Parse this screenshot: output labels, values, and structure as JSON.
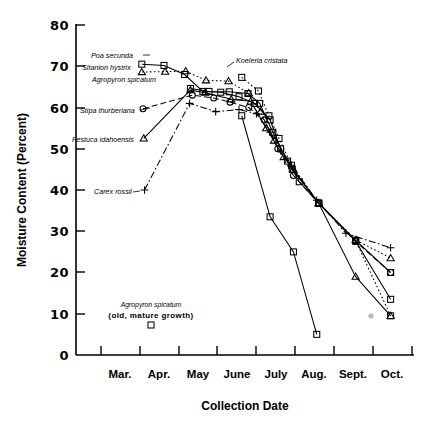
{
  "chart_data": {
    "type": "line",
    "title": "",
    "xlabel": "Collection Date",
    "ylabel": "Moisture Content (Percent)",
    "ylim": [
      0,
      80
    ],
    "yticks": [
      0,
      10,
      20,
      30,
      40,
      50,
      60,
      70,
      80
    ],
    "grid": false,
    "legend_position": "inline-labels",
    "x_categories": [
      "Mar.",
      "Apr.",
      "May",
      "June",
      "July",
      "Aug.",
      "Sept.",
      "Oct."
    ],
    "x_axis_note": "Tick marks delimit months; labels centered between ticks",
    "series": [
      {
        "name": "Poa secunda",
        "marker": "square",
        "dash": "solid",
        "points": [
          {
            "x": 2.05,
            "y": 70.5
          },
          {
            "x": 2.62,
            "y": 70.2
          },
          {
            "x": 3.15,
            "y": 68.0
          },
          {
            "x": 3.62,
            "y": 63.9
          },
          {
            "x": 4.08,
            "y": 63.7
          },
          {
            "x": 4.55,
            "y": 62.6
          },
          {
            "x": 4.95,
            "y": 61.0
          },
          {
            "x": 5.35,
            "y": 57.0
          },
          {
            "x": 5.62,
            "y": 50.0
          },
          {
            "x": 5.92,
            "y": 45.0
          },
          {
            "x": 6.6,
            "y": 36.8
          },
          {
            "x": 7.55,
            "y": 27.8
          },
          {
            "x": 8.45,
            "y": 20.0
          }
        ]
      },
      {
        "name": "Sitanion hystrix",
        "marker": "triangle",
        "dash": "dotted",
        "points": [
          {
            "x": 2.05,
            "y": 68.6
          },
          {
            "x": 2.65,
            "y": 68.7
          },
          {
            "x": 3.18,
            "y": 68.8
          },
          {
            "x": 3.7,
            "y": 66.6
          },
          {
            "x": 4.28,
            "y": 66.4
          },
          {
            "x": 4.8,
            "y": 63.5
          },
          {
            "x": 5.1,
            "y": 59.0
          },
          {
            "x": 5.45,
            "y": 52.0
          },
          {
            "x": 5.95,
            "y": 45.0
          },
          {
            "x": 6.6,
            "y": 36.8
          },
          {
            "x": 7.55,
            "y": 27.9
          },
          {
            "x": 8.45,
            "y": 23.5
          }
        ]
      },
      {
        "name": "Agropyron spicatum",
        "marker": "square",
        "dash": "solid",
        "points": [
          {
            "x": 3.3,
            "y": 64.6
          },
          {
            "x": 3.78,
            "y": 63.9
          },
          {
            "x": 4.3,
            "y": 63.8
          },
          {
            "x": 4.78,
            "y": 63.4
          },
          {
            "x": 5.08,
            "y": 61.0
          },
          {
            "x": 5.42,
            "y": 54.0
          },
          {
            "x": 5.8,
            "y": 47.0
          },
          {
            "x": 6.1,
            "y": 42.0
          },
          {
            "x": 6.6,
            "y": 36.8
          },
          {
            "x": 7.55,
            "y": 27.6
          },
          {
            "x": 8.45,
            "y": 13.5
          }
        ]
      },
      {
        "name": "Koeleria cristata",
        "marker": "square",
        "dash": "dotted",
        "points": [
          {
            "x": 4.62,
            "y": 67.3
          },
          {
            "x": 5.05,
            "y": 64.0
          },
          {
            "x": 5.32,
            "y": 58.0
          },
          {
            "x": 5.58,
            "y": 52.5
          },
          {
            "x": 5.9,
            "y": 46.0
          },
          {
            "x": 6.6,
            "y": 36.8
          },
          {
            "x": 7.55,
            "y": 27.7
          },
          {
            "x": 8.45,
            "y": 9.5
          }
        ]
      },
      {
        "name": "Stipa thurberiana",
        "marker": "circle",
        "dash": "dashed",
        "points": [
          {
            "x": 2.08,
            "y": 59.7
          },
          {
            "x": 3.35,
            "y": 63.0
          },
          {
            "x": 3.9,
            "y": 62.3
          },
          {
            "x": 4.32,
            "y": 61.3
          },
          {
            "x": 4.8,
            "y": 60.0
          },
          {
            "x": 5.2,
            "y": 57.0
          },
          {
            "x": 5.55,
            "y": 50.0
          },
          {
            "x": 5.95,
            "y": 43.5
          },
          {
            "x": 6.6,
            "y": 36.8
          },
          {
            "x": 7.55,
            "y": 27.5
          },
          {
            "x": 8.45,
            "y": 20.0
          }
        ]
      },
      {
        "name": "Festuca idahoensis",
        "marker": "triangle",
        "dash": "solid",
        "points": [
          {
            "x": 2.1,
            "y": 52.5
          },
          {
            "x": 3.3,
            "y": 64.2
          },
          {
            "x": 3.68,
            "y": 63.6
          },
          {
            "x": 4.35,
            "y": 62.0
          },
          {
            "x": 4.85,
            "y": 61.5
          },
          {
            "x": 5.25,
            "y": 55.0
          },
          {
            "x": 5.7,
            "y": 48.0
          },
          {
            "x": 6.6,
            "y": 36.8
          },
          {
            "x": 7.55,
            "y": 19.0
          },
          {
            "x": 8.45,
            "y": 9.5
          }
        ]
      },
      {
        "name": "Carex rossii",
        "marker": "plus",
        "dash": "dashdot",
        "points": [
          {
            "x": 2.12,
            "y": 40.0
          },
          {
            "x": 3.28,
            "y": 61.0
          },
          {
            "x": 3.95,
            "y": 59.0
          },
          {
            "x": 4.55,
            "y": 59.5
          },
          {
            "x": 5.0,
            "y": 58.5
          },
          {
            "x": 5.35,
            "y": 54.0
          },
          {
            "x": 5.9,
            "y": 46.0
          },
          {
            "x": 6.55,
            "y": 37.5
          },
          {
            "x": 7.3,
            "y": 29.5
          },
          {
            "x": 8.45,
            "y": 26.0
          }
        ]
      },
      {
        "name": "Agropyron spicatum (old, mature growth)",
        "marker": "square",
        "dash": "solid",
        "points": [
          {
            "x": 4.62,
            "y": 58.0
          },
          {
            "x": 5.35,
            "y": 33.5
          },
          {
            "x": 5.95,
            "y": 25.0
          },
          {
            "x": 6.55,
            "y": 5.0
          }
        ]
      }
    ],
    "inline_labels": [
      {
        "text": "Poa secunda",
        "marker": "square"
      },
      {
        "text": "Sitanion hystrix",
        "marker": "triangle"
      },
      {
        "text": "Agropyron spicatum",
        "marker": "none"
      },
      {
        "text": "Koeleria cristata",
        "marker": "square"
      },
      {
        "text": "Stipa thurberiana",
        "marker": "circle"
      },
      {
        "text": "Festuca idahoensis",
        "marker": "triangle"
      },
      {
        "text": "Carex rossii",
        "marker": "plus"
      }
    ],
    "annotation": {
      "line1": "Agropyron spicatum",
      "line2": "(old, mature growth)",
      "marker": "square"
    }
  },
  "labels": {
    "y_axis_title": "Moisture Content (Percent)",
    "x_axis_title": "Collection Date",
    "y_0": "0",
    "y_10": "10",
    "y_20": "20",
    "y_30": "30",
    "y_40": "40",
    "y_50": "50",
    "y_60": "60",
    "y_70": "70",
    "y_80": "80",
    "x_mar": "Mar.",
    "x_apr": "Apr.",
    "x_may": "May",
    "x_june": "June",
    "x_july": "July",
    "x_aug": "Aug.",
    "x_sept": "Sept.",
    "x_oct": "Oct.",
    "s_poa": "Poa secunda",
    "s_sitanion": "Sitanion hystrix",
    "s_agropyron": "Agropyron spicatum",
    "s_koeleria": "Koeleria cristata",
    "s_stipa": "Stipa thurberiana",
    "s_festuca": "Festuca idahoensis",
    "s_carex": "Carex rossii",
    "note1": "Agropyron spicatum",
    "note2": "(old, mature growth)"
  }
}
